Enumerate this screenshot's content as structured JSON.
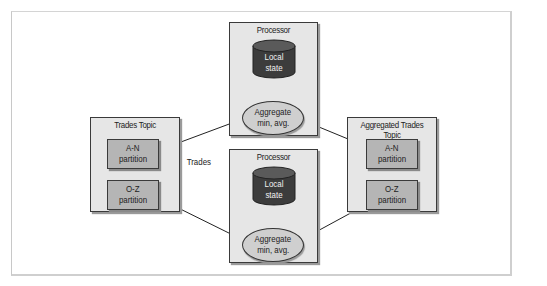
{
  "diagram": {
    "source_topic": {
      "title": "Trades Topic",
      "partitions": [
        {
          "line1": "A-N",
          "line2": "partition"
        },
        {
          "line1": "O-Z",
          "line2": "partition"
        }
      ]
    },
    "edge_label": "Trades",
    "processors": [
      {
        "title": "Processor",
        "store": {
          "line1": "Local",
          "line2": "state"
        },
        "operation": {
          "line1": "Aggregate",
          "line2": "min, avg."
        }
      },
      {
        "title": "Processor",
        "store": {
          "line1": "Local",
          "line2": "state"
        },
        "operation": {
          "line1": "Aggregate",
          "line2": "min, avg."
        }
      }
    ],
    "sink_topic": {
      "title": "Aggregated Trades Topic",
      "partitions": [
        {
          "line1": "A-N",
          "line2": "partition"
        },
        {
          "line1": "O-Z",
          "line2": "partition"
        }
      ]
    },
    "edges": [
      {
        "from": "Trades Topic / A-N partition",
        "to": "Processor 1 / Aggregate"
      },
      {
        "from": "Trades Topic / O-Z partition",
        "to": "Processor 2 / Aggregate"
      },
      {
        "from": "Processor 1 / Aggregate",
        "to": "Aggregated Trades Topic / A-N partition"
      },
      {
        "from": "Processor 2 / Aggregate",
        "to": "Aggregated Trades Topic / O-Z partition"
      },
      {
        "from": "Local state",
        "to": "Aggregate",
        "bidirectional": true
      }
    ],
    "colors": {
      "box_fill": "#e6e6e6",
      "partition_fill": "#b5b5b5",
      "db_fill": "#3c3c3c",
      "ellipse_fill": "#cfcfcf",
      "stroke": "#333333"
    }
  }
}
